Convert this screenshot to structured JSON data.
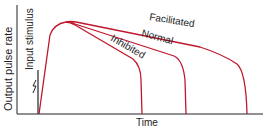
{
  "diagram": {
    "y_axis_label": "Output pulse rate",
    "x_axis_label": "Time",
    "stimulus_label": "Input stimulus",
    "curves": [
      {
        "name": "Facilitated",
        "color": "#c0182c"
      },
      {
        "name": "Normal",
        "color": "#c0182c"
      },
      {
        "name": "Inhibited",
        "color": "#c0182c"
      }
    ],
    "axis_color": "#222222"
  }
}
